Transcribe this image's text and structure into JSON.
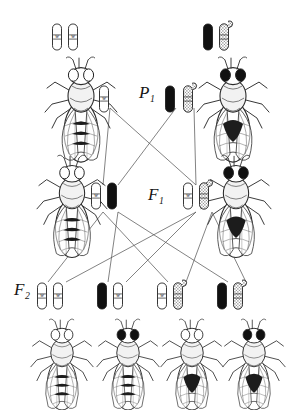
{
  "figure": {
    "background_color": "#ffffff",
    "line_color": "#4a4a4a",
    "ink_color": "#1a1a1a",
    "width": 292,
    "height": 410
  },
  "generation_labels": [
    {
      "name": "p1",
      "base": "P",
      "subscript": "1",
      "x": 139,
      "y": 84
    },
    {
      "name": "f1",
      "base": "F",
      "subscript": "1",
      "x": 148,
      "y": 186
    },
    {
      "name": "f2",
      "base": "F",
      "subscript": "2",
      "x": 14,
      "y": 281
    }
  ],
  "chromosome_fills": {
    "white": "#ffffff",
    "black": "#111111",
    "stippled": "#d9d9d9"
  },
  "rows": {
    "parent_row": {
      "label": "P1 parental flies",
      "flies": [
        {
          "name": "parent-fly-left",
          "x": 44,
          "y": 57,
          "w": 74,
          "h": 92,
          "eye": "white",
          "abdomen": "banded"
        },
        {
          "name": "parent-fly-right",
          "x": 196,
          "y": 57,
          "w": 74,
          "h": 92,
          "eye": "dark",
          "abdomen": "dark-patch"
        }
      ],
      "chromosome_pairs": [
        {
          "name": "parent-left-genotype",
          "x": 57,
          "y": 24,
          "chromosomes": [
            {
              "fill": "white",
              "marker": "w",
              "shape": "rod"
            },
            {
              "fill": "white",
              "marker": "w",
              "shape": "rod"
            }
          ]
        },
        {
          "name": "parent-right-genotype",
          "x": 208,
          "y": 24,
          "chromosomes": [
            {
              "fill": "black",
              "marker": "",
              "shape": "rod"
            },
            {
              "fill": "stippled",
              "marker": "",
              "shape": "hooked"
            }
          ]
        }
      ]
    },
    "gamete_row": {
      "label": "P1 gametes",
      "chromosomes": [
        {
          "name": "gamete-maternal",
          "x": 104,
          "y": 86,
          "fill": "white",
          "marker": "w",
          "shape": "rod"
        },
        {
          "name": "gamete-paternal-black",
          "x": 170,
          "y": 86,
          "fill": "black",
          "marker": "",
          "shape": "rod"
        },
        {
          "name": "gamete-paternal-stippled",
          "x": 188,
          "y": 86,
          "fill": "stippled",
          "marker": "",
          "shape": "hooked"
        }
      ]
    },
    "f1_row": {
      "label": "F1 offspring",
      "flies": [
        {
          "name": "f1-fly-left",
          "x": 36,
          "y": 155,
          "w": 72,
          "h": 90,
          "eye": "white",
          "abdomen": "banded"
        },
        {
          "name": "f1-fly-right",
          "x": 200,
          "y": 155,
          "w": 72,
          "h": 90,
          "eye": "dark",
          "abdomen": "dark-patch"
        }
      ],
      "chromosome_pairs": [
        {
          "name": "f1-left-genotype",
          "x": 96,
          "y": 183,
          "chromosomes": [
            {
              "fill": "white",
              "marker": "w",
              "shape": "rod"
            },
            {
              "fill": "black",
              "marker": "",
              "shape": "rod"
            }
          ]
        },
        {
          "name": "f1-right-genotype",
          "x": 188,
          "y": 183,
          "chromosomes": [
            {
              "fill": "white",
              "marker": "w",
              "shape": "rod"
            },
            {
              "fill": "stippled",
              "marker": "",
              "shape": "hooked"
            }
          ]
        }
      ]
    },
    "f2_row": {
      "label": "F2 offspring",
      "chromosome_pairs": [
        {
          "name": "f2-genotype-1",
          "x": 42,
          "y": 283,
          "chromosomes": [
            {
              "fill": "white",
              "marker": "w",
              "shape": "rod"
            },
            {
              "fill": "white",
              "marker": "w",
              "shape": "rod"
            }
          ]
        },
        {
          "name": "f2-genotype-2",
          "x": 102,
          "y": 283,
          "chromosomes": [
            {
              "fill": "black",
              "marker": "",
              "shape": "rod"
            },
            {
              "fill": "white",
              "marker": "w",
              "shape": "rod"
            }
          ]
        },
        {
          "name": "f2-genotype-3",
          "x": 162,
          "y": 283,
          "chromosomes": [
            {
              "fill": "white",
              "marker": "w",
              "shape": "rod"
            },
            {
              "fill": "stippled",
              "marker": "",
              "shape": "hooked"
            }
          ]
        },
        {
          "name": "f2-genotype-4",
          "x": 222,
          "y": 283,
          "chromosomes": [
            {
              "fill": "black",
              "marker": "",
              "shape": "rod"
            },
            {
              "fill": "stippled",
              "marker": "",
              "shape": "hooked"
            }
          ]
        }
      ],
      "flies": [
        {
          "name": "f2-fly-1",
          "x": 30,
          "y": 315,
          "w": 64,
          "h": 88,
          "eye": "white",
          "abdomen": "banded"
        },
        {
          "name": "f2-fly-2",
          "x": 96,
          "y": 315,
          "w": 64,
          "h": 88,
          "eye": "dark",
          "abdomen": "banded"
        },
        {
          "name": "f2-fly-3",
          "x": 160,
          "y": 315,
          "w": 64,
          "h": 88,
          "eye": "white",
          "abdomen": "dark-patch"
        },
        {
          "name": "f2-fly-4",
          "x": 222,
          "y": 315,
          "w": 64,
          "h": 88,
          "eye": "dark",
          "abdomen": "dark-patch"
        }
      ]
    }
  },
  "inheritance_lines": {
    "gametes_to_f1": [
      {
        "from": [
          110,
          108
        ],
        "to": [
          103,
          185
        ]
      },
      {
        "from": [
          110,
          108
        ],
        "to": [
          196,
          185
        ]
      },
      {
        "from": [
          176,
          108
        ],
        "to": [
          118,
          185
        ]
      },
      {
        "from": [
          194,
          108
        ],
        "to": [
          196,
          185
        ]
      }
    ],
    "f1_to_f2": [
      {
        "from": [
          103,
          212
        ],
        "to": [
          48,
          282
        ]
      },
      {
        "from": [
          103,
          212
        ],
        "to": [
          168,
          282
        ]
      },
      {
        "from": [
          118,
          212
        ],
        "to": [
          108,
          282
        ]
      },
      {
        "from": [
          118,
          212
        ],
        "to": [
          228,
          282
        ]
      },
      {
        "from": [
          196,
          212
        ],
        "to": [
          66,
          282
        ]
      },
      {
        "from": [
          196,
          212
        ],
        "to": [
          126,
          282
        ]
      },
      {
        "from": [
          212,
          212
        ],
        "to": [
          186,
          282
        ]
      },
      {
        "from": [
          212,
          212
        ],
        "to": [
          246,
          282
        ]
      }
    ]
  }
}
